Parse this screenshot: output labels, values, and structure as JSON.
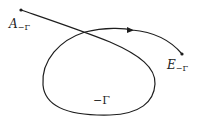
{
  "diagram": {
    "type": "contour-path",
    "stroke_color": "#1e1e1e",
    "background": "#ffffff",
    "labels": {
      "start": {
        "main": "A",
        "sub": "−Γ"
      },
      "end": {
        "main": "E",
        "sub": "−Γ"
      },
      "loop": "−Γ"
    },
    "nodes": [
      {
        "id": "start",
        "label": "A−Γ"
      },
      {
        "id": "end",
        "label": "E−Γ"
      }
    ],
    "edges": [
      {
        "from": "start",
        "to": "end",
        "label": "−Γ",
        "shape": "self-crossing loop",
        "direction": "arrow near top toward E"
      }
    ]
  }
}
